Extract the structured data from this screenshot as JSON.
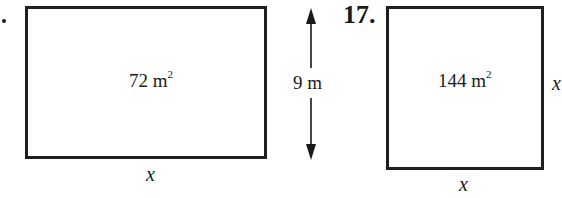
{
  "problems": [
    {
      "number": ".",
      "shape": "rectangle",
      "area_value": "72 m",
      "area_exponent": "2",
      "height_label": "9 m",
      "width_label": "x"
    },
    {
      "number": "17.",
      "shape": "square",
      "area_value": "144 m",
      "area_exponent": "2",
      "side_label_right": "x",
      "side_label_bottom": "x"
    }
  ]
}
